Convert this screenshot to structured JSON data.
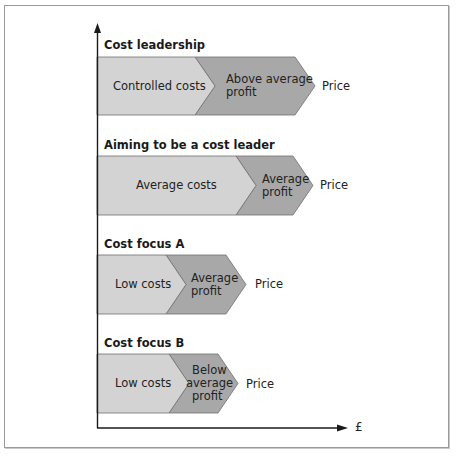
{
  "diagram": {
    "axis": {
      "x_label": "£",
      "y_label": ""
    },
    "colors": {
      "cost_fill": "#d3d3d3",
      "profit_fill": "#a8a8a8",
      "outline": "#6e6e6e",
      "axis": "#1a1a1a"
    },
    "rows": [
      {
        "title": "Cost leadership",
        "cost_label": "Controlled costs",
        "profit_label_lines": [
          "Above average",
          "profit"
        ],
        "end_label": "Price"
      },
      {
        "title": "Aiming to be a cost leader",
        "cost_label": "Average costs",
        "profit_label_lines": [
          "Average",
          "profit"
        ],
        "end_label": "Price"
      },
      {
        "title": "Cost focus A",
        "cost_label": "Low costs",
        "profit_label_lines": [
          "Average",
          "profit"
        ],
        "end_label": "Price"
      },
      {
        "title": "Cost focus B",
        "cost_label": "Low costs",
        "profit_label_lines": [
          "Below",
          "average",
          "profit"
        ],
        "end_label": "Price"
      }
    ]
  }
}
